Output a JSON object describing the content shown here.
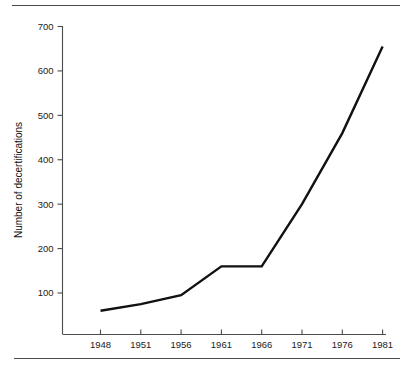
{
  "figure": {
    "background_color": "#ffffff",
    "line_color": "#111111",
    "axis_color": "#4b4b4b",
    "rule_color": "#4a4a4a",
    "top_rule_label": "top-horizontal-rule",
    "bottom_rule_label": "bottom-horizontal-rule"
  },
  "chart_data": {
    "type": "line",
    "title": "",
    "subtitle": "",
    "xlabel": "",
    "ylabel": "Number of decertifications",
    "categories": [
      "1948",
      "1951",
      "1956",
      "1961",
      "1966",
      "1971",
      "1976",
      "1981"
    ],
    "x": [
      1948,
      1951,
      1956,
      1961,
      1966,
      1971,
      1976,
      1981
    ],
    "values": [
      60,
      75,
      95,
      160,
      160,
      300,
      460,
      655
    ],
    "series": [
      {
        "name": "Number of decertifications",
        "values": [
          60,
          75,
          95,
          160,
          160,
          300,
          460,
          655
        ]
      }
    ],
    "xlim": [
      1948,
      1981
    ],
    "ylim": [
      0,
      700
    ],
    "ytick_labels": [
      "100",
      "200",
      "300",
      "400",
      "500",
      "600",
      "700"
    ],
    "ytick_values": [
      100,
      200,
      300,
      400,
      500,
      600,
      700
    ],
    "xtick_labels": [
      "1948",
      "1951",
      "1956",
      "1961",
      "1966",
      "1971",
      "1976",
      "1981"
    ],
    "grid": false,
    "legend": false,
    "legend_position": "none",
    "axis_spines": [
      "left",
      "bottom"
    ],
    "annotations": []
  }
}
